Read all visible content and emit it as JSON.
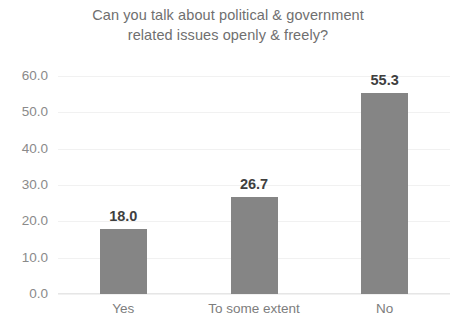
{
  "chart_data": {
    "type": "bar",
    "title": "Can you talk about political & government related issues openly & freely?",
    "title_lines": [
      "Can you talk about political & government",
      "related issues openly & freely?"
    ],
    "categories": [
      "Yes",
      "To some extent",
      "No"
    ],
    "values": [
      18.0,
      26.7,
      55.3
    ],
    "data_labels": [
      "18.0",
      "26.7",
      "55.3"
    ],
    "xlabel": "",
    "ylabel": "",
    "ylim": [
      0.0,
      60.0
    ],
    "ytick_step": 10.0,
    "ytick_labels": [
      "60.0",
      "50.0",
      "40.0",
      "30.0",
      "20.0",
      "10.0",
      "0.0"
    ],
    "ytick_values": [
      60.0,
      50.0,
      40.0,
      30.0,
      20.0,
      10.0,
      0.0
    ],
    "grid": true,
    "legend": false,
    "series": [
      {
        "name": "",
        "values": [
          18.0,
          26.7,
          55.3
        ],
        "color": "#858585"
      }
    ],
    "colors": {
      "bar": "#858585",
      "title_text": "#6f6f6f",
      "tick_text": "#8a8a8a",
      "category_text": "#7d7d7d",
      "data_label_text": "#3f3f3f",
      "gridline": "#f1f1f1",
      "background": "#ffffff"
    }
  }
}
